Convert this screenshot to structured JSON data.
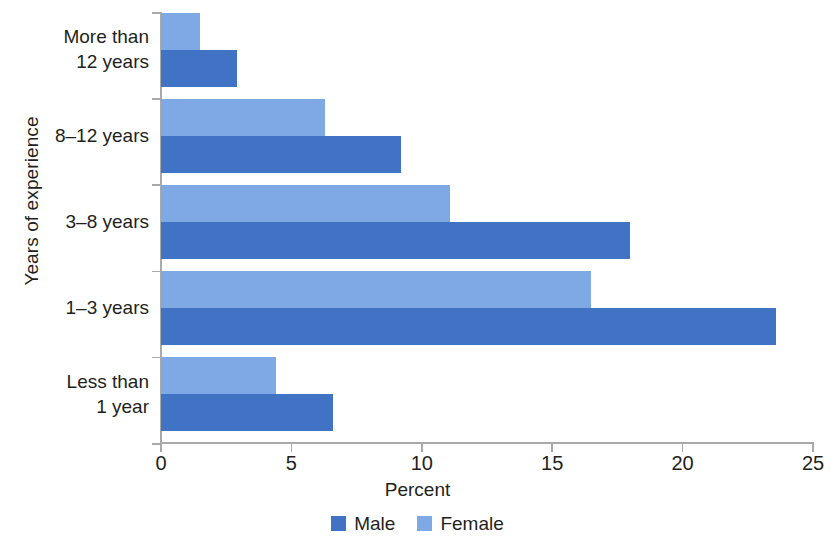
{
  "chart_data": {
    "type": "bar",
    "orientation": "horizontal",
    "title": "",
    "xlabel": "Percent",
    "ylabel": "Years of experience",
    "xlim": [
      0,
      25
    ],
    "xticks": [
      0,
      5,
      10,
      15,
      20,
      25
    ],
    "xtick_labels": [
      "0",
      "5",
      "10",
      "15",
      "20",
      "25"
    ],
    "grid": false,
    "legend_position": "bottom-center",
    "categories": [
      "More than\n12 years",
      "8–12 years",
      "3–8 years",
      "1–3 years",
      "Less than\n1 year"
    ],
    "category_labels": [
      {
        "line1": "More than",
        "line2": "12 years"
      },
      {
        "line1": "8–12 years",
        "line2": ""
      },
      {
        "line1": "3–8 years",
        "line2": ""
      },
      {
        "line1": "1–3 years",
        "line2": ""
      },
      {
        "line1": "Less than",
        "line2": "1 year"
      }
    ],
    "series": [
      {
        "name": "Male",
        "color": "#4073c3",
        "values": [
          2.9,
          9.2,
          18.0,
          23.6,
          6.6
        ]
      },
      {
        "name": "Female",
        "color": "#7fa9e4",
        "values": [
          1.5,
          6.3,
          11.1,
          16.5,
          4.4
        ]
      }
    ]
  },
  "legend": {
    "items": [
      {
        "label": "Male",
        "color": "#4073c3"
      },
      {
        "label": "Female",
        "color": "#7fa9e4"
      }
    ]
  },
  "axes": {
    "x_title": "Percent",
    "y_title": "Years of experience",
    "axis_color": "#a9a9a9"
  }
}
